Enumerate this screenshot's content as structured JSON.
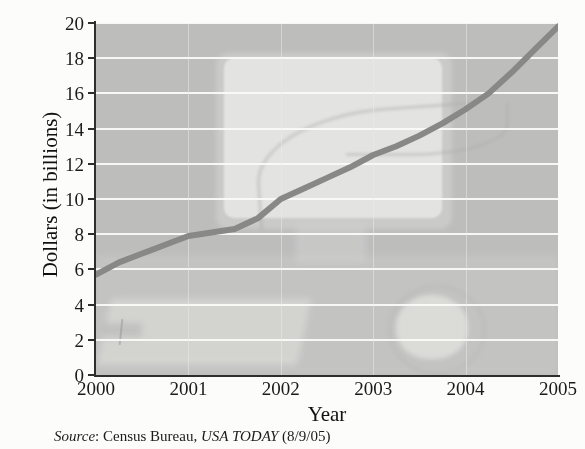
{
  "chart_data": {
    "type": "line",
    "title": "",
    "subtitle": "",
    "xlabel": "Year",
    "ylabel": "Dollars (in billions)",
    "xlim": [
      2000,
      2005
    ],
    "ylim": [
      0,
      20
    ],
    "grid": true,
    "legend": false,
    "legend_position": "none",
    "xticks": [
      "2000",
      "2001",
      "2002",
      "2003",
      "2004",
      "2005"
    ],
    "yticks": [
      "0",
      "2",
      "4",
      "6",
      "8",
      "10",
      "12",
      "14",
      "16",
      "18",
      "20"
    ],
    "x": [
      2000.0,
      2000.25,
      2000.5,
      2000.75,
      2001.0,
      2001.25,
      2001.5,
      2001.75,
      2002.0,
      2002.25,
      2002.5,
      2002.75,
      2003.0,
      2003.25,
      2003.5,
      2003.75,
      2004.0,
      2004.25,
      2004.5,
      2004.75,
      2005.0
    ],
    "series": [
      {
        "name": "Online retail sales",
        "color": "#8a8b89",
        "values": [
          5.7,
          6.4,
          6.9,
          7.4,
          7.9,
          8.1,
          8.3,
          8.9,
          10.0,
          10.6,
          11.2,
          11.8,
          12.5,
          13.0,
          13.6,
          14.3,
          15.1,
          16.0,
          17.2,
          18.5,
          19.8
        ]
      }
    ],
    "annotations": [],
    "source": {
      "label": "Source",
      "separator": ": ",
      "agency": "Census Bureau, ",
      "publication": "USA TODAY",
      "date": " (8/9/05)"
    }
  },
  "axes": {
    "y_title": "Dollars (in billions)",
    "x_title": "Year"
  },
  "style": {
    "plot_background": "#bfc0bf",
    "gridline_color": "#fdfdfd",
    "line_color": "#8a8b89",
    "axis_color": "#2e2e2e",
    "text_color": "#1b1b1b"
  }
}
